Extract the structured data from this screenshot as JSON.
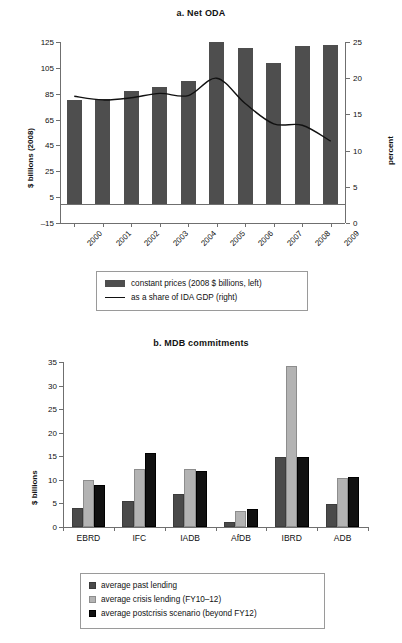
{
  "figure": {
    "panels": [
      "a. Net ODA",
      "b. MDB commitments"
    ]
  },
  "panel_a": {
    "title": "a. Net ODA",
    "y_left_title": "$ billions (2008)",
    "y_right_title": "percent",
    "x_title": "year",
    "legend": [
      {
        "marker": "bar-swatch",
        "label": "constant prices (2008 $ billions, left)"
      },
      {
        "marker": "line-swatch",
        "label": "as a share of IDA GDP (right)"
      }
    ]
  },
  "panel_b": {
    "title": "b. MDB commitments",
    "y_title": "$ billions",
    "legend": [
      {
        "marker": "dark-square",
        "label": "average past lending"
      },
      {
        "marker": "light-square",
        "label": "average crisis lending (FY10–12)"
      },
      {
        "marker": "black-square",
        "label": "average postcrisis scenario (beyond FY12)"
      }
    ]
  },
  "chart_data": [
    {
      "type": "bar",
      "id": "net-oda",
      "title": "a. Net ODA",
      "xlabel": "year",
      "ylabel": "$ billions (2008)",
      "y2label": "percent",
      "categories": [
        "2000",
        "2001",
        "2002",
        "2003",
        "2004",
        "2005",
        "2006",
        "2007",
        "2008",
        "2009"
      ],
      "ylim": [
        -15,
        125
      ],
      "yticks": [
        -15,
        5,
        25,
        45,
        65,
        85,
        105,
        125
      ],
      "y2lim": [
        0,
        25
      ],
      "y2ticks": [
        0,
        5,
        10,
        15,
        20,
        25
      ],
      "grid": false,
      "legend_position": "below",
      "series": [
        {
          "name": "constant prices (2008 $ billions, left)",
          "kind": "bar",
          "axis": "left",
          "color": "#4e4e4e",
          "values": [
            80,
            81,
            87,
            90,
            95,
            125,
            120,
            109,
            122,
            123
          ]
        },
        {
          "name": "as a share of IDA GDP (right)",
          "kind": "line",
          "axis": "right",
          "color": "#111111",
          "values": [
            17.5,
            17.0,
            17.3,
            17.9,
            17.6,
            20.0,
            16.5,
            13.7,
            13.5,
            11.3
          ]
        }
      ]
    },
    {
      "type": "bar",
      "id": "mdb-commitments",
      "title": "b. MDB commitments",
      "xlabel": "",
      "ylabel": "$ billions",
      "categories": [
        "EBRD",
        "IFC",
        "IADB",
        "AfDB",
        "IBRD",
        "ADB"
      ],
      "ylim": [
        0,
        35
      ],
      "yticks": [
        0,
        5,
        10,
        15,
        20,
        25,
        30,
        35
      ],
      "grid": false,
      "legend_position": "below",
      "series": [
        {
          "name": "average past lending",
          "color": "#4a4a4a",
          "values": [
            4.1,
            5.6,
            6.9,
            1.1,
            14.9,
            4.9
          ]
        },
        {
          "name": "average crisis lending (FY10–12)",
          "color": "#b3b3b3",
          "values": [
            9.9,
            12.2,
            12.3,
            3.3,
            34.1,
            10.3
          ]
        },
        {
          "name": "average postcrisis scenario (beyond FY12)",
          "color": "#111111",
          "values": [
            9.0,
            15.8,
            11.8,
            3.9,
            14.9,
            10.6
          ]
        }
      ]
    }
  ]
}
